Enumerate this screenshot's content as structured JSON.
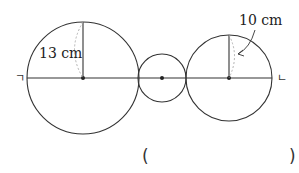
{
  "diagram": {
    "labels": {
      "left_point": "ㄱ",
      "right_point": "ㄴ",
      "left_radius": "13 cm",
      "right_radius": "10 cm"
    },
    "answer_blank": {
      "open": "(",
      "close": ")"
    },
    "circles": [
      {
        "name": "large-left",
        "cx": 83,
        "cy": 78,
        "r": 56
      },
      {
        "name": "small-middle",
        "cx": 162,
        "cy": 78,
        "r": 24
      },
      {
        "name": "medium-right",
        "cx": 229,
        "cy": 78,
        "r": 43
      }
    ],
    "colors": {
      "stroke": "#333333",
      "dashed": "#aaaaaa"
    }
  }
}
